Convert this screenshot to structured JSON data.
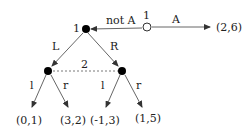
{
  "diagram": {
    "type": "extensive-form game tree",
    "root": {
      "player_label": "1",
      "style": "open-circle"
    },
    "root_actions": {
      "continue": "A",
      "stop": "not A"
    },
    "root_payoff": "(2,6)",
    "node_player1": {
      "player_label": "1"
    },
    "player1_actions": {
      "left": "L",
      "right": "R"
    },
    "info_set_label": "2",
    "player2_actions_left": {
      "left": "l",
      "right": "r"
    },
    "player2_actions_right": {
      "left": "l",
      "right": "r"
    },
    "payoffs": [
      "(0,1)",
      "(3,2)",
      "(-1,3)",
      "(1,5)"
    ]
  }
}
